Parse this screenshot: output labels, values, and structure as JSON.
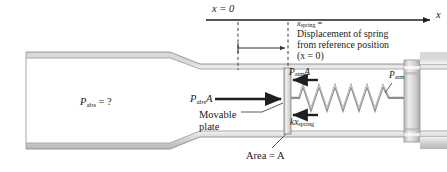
{
  "figure": {
    "type": "physics-free-body-diagram"
  },
  "axis": {
    "origin_label": "x = 0",
    "axis_label": "x",
    "origin_x_px": 238,
    "arrow_end_x_px": 433,
    "axis_y_px": 20
  },
  "callout": {
    "line1": "x",
    "line1_sub": "spring",
    "line1_eq": "=",
    "line2": "Displacement of spring",
    "line3": "from reference position",
    "line4": "(x = 0)"
  },
  "labels": {
    "p_abs_question_base": "P",
    "p_abs_question_sub": "abs",
    "p_abs_question_tail": " = ?",
    "p_abs_A_base": "P",
    "p_abs_A_sub": "abs",
    "p_abs_A_tail": "A",
    "p_atm_A_base": "P",
    "p_atm_A_sub": "atm",
    "p_atm_A_tail": "A",
    "kx_spring_base": "kx",
    "kx_spring_sub": "spring",
    "p_atm_base": "P",
    "p_atm_sub": "atm",
    "movable_line1": "Movable",
    "movable_line2": "plate",
    "area_text": "Area = A"
  },
  "watermark": {
    "text": ""
  },
  "colors": {
    "ink": "#1a1a1a",
    "tube_fill": "#ffffff",
    "tube_edge": "#9a9a9a",
    "tube_shadow": "#c9c9c9",
    "plate_fill": "#dcdcdc",
    "plate_edge": "#8c8c8c",
    "spring": "#8e8e8e",
    "wall": "#c4c4c4",
    "arrow": "#222222",
    "dash": "#4a4a4a"
  },
  "geometry": {
    "plate_x_px": 284,
    "plate_width_px": 7,
    "plate_top_px": 68,
    "plate_bottom_px": 134,
    "spring_start_px": 297,
    "spring_end_px": 392,
    "spring_center_y_px": 98,
    "spring_coils": 11,
    "dash_left_px": 238,
    "dash_right_px": 288
  }
}
